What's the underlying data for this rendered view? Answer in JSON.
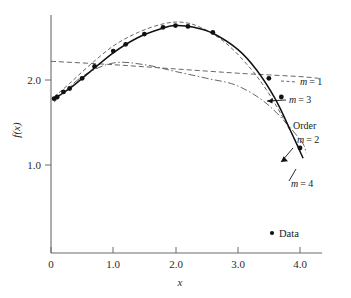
{
  "chart_data": {
    "type": "line",
    "title": "",
    "subtitle": "",
    "xlabel": "x",
    "ylabel": "f(x)",
    "xlim": [
      -0.05,
      4.4
    ],
    "ylim": [
      0.55,
      2.95
    ],
    "xticks": [
      0,
      1.0,
      2.0,
      3.0,
      4.0
    ],
    "xtick_labels": [
      "0",
      "1.0",
      "2.0",
      "3.0",
      "4.0"
    ],
    "yticks": [
      1.0,
      2.0
    ],
    "ytick_labels": [
      "1.0",
      "2.0"
    ],
    "grid": false,
    "legend_position": "bottom-right",
    "legend_entries": [
      "Data"
    ],
    "scatter": {
      "name": "Data",
      "marker": "filled-circle",
      "color": "#111111",
      "x": [
        0.05,
        0.1,
        0.2,
        0.3,
        0.5,
        0.7,
        1.0,
        1.2,
        1.5,
        1.8,
        2.0,
        2.2,
        2.6,
        3.5,
        3.7,
        4.0
      ],
      "y": [
        1.78,
        1.8,
        1.86,
        1.9,
        2.02,
        2.16,
        2.34,
        2.42,
        2.54,
        2.62,
        2.64,
        2.63,
        2.56,
        2.02,
        1.8,
        1.2
      ]
    },
    "series": [
      {
        "name": "m = 1",
        "order": 1,
        "style": "dashed",
        "color": "#555555",
        "x": [
          0.0,
          1.0,
          2.0,
          3.0,
          3.5,
          4.0,
          4.3
        ],
        "y": [
          2.22,
          2.18,
          2.13,
          2.08,
          2.06,
          2.04,
          2.02
        ]
      },
      {
        "name": "m = 2",
        "order": 2,
        "style": "dash-dot",
        "color": "#555555",
        "x": [
          0.05,
          0.5,
          1.0,
          1.5,
          2.0,
          2.5,
          3.0,
          3.5,
          4.0,
          4.1
        ],
        "y": [
          1.74,
          2.04,
          2.2,
          2.18,
          2.1,
          2.02,
          1.93,
          1.7,
          1.3,
          1.14
        ]
      },
      {
        "name": "m = 3",
        "order": 3,
        "style": "dashed",
        "color": "#555555",
        "x": [
          0.05,
          0.3,
          0.6,
          1.0,
          1.4,
          1.8,
          2.1,
          2.4,
          2.8,
          3.2,
          3.5,
          3.8,
          4.0
        ],
        "y": [
          1.8,
          1.96,
          2.16,
          2.4,
          2.56,
          2.66,
          2.68,
          2.62,
          2.44,
          2.14,
          1.84,
          1.46,
          1.18
        ]
      },
      {
        "name": "m = 4",
        "order": 4,
        "style": "solid",
        "color": "#111111",
        "x": [
          0.05,
          0.3,
          0.6,
          1.0,
          1.4,
          1.8,
          2.0,
          2.3,
          2.6,
          3.0,
          3.3,
          3.6,
          3.85,
          4.05
        ],
        "y": [
          1.78,
          1.9,
          2.08,
          2.32,
          2.5,
          2.61,
          2.64,
          2.62,
          2.55,
          2.36,
          2.12,
          1.78,
          1.4,
          1.08
        ]
      }
    ],
    "annotations": [
      {
        "id": "m1",
        "text_prefix": "m",
        "text_suffix": "= 1",
        "x_px": 314,
        "y_px": 83
      },
      {
        "id": "m3",
        "text_prefix": "m",
        "text_suffix": "= 3",
        "x_px": 303,
        "y_px": 101
      },
      {
        "id": "order",
        "text_prefix": "",
        "text_suffix": "Order",
        "x_px": 312,
        "y_px": 127
      },
      {
        "id": "m2",
        "text_prefix": "m",
        "text_suffix": "= 2",
        "x_px": 311,
        "y_px": 141
      },
      {
        "id": "m4",
        "text_prefix": "m",
        "text_suffix": "= 4",
        "x_px": 305,
        "y_px": 185
      }
    ]
  },
  "labels": {
    "xaxis_title": "x",
    "yaxis_title": "f(x)",
    "xtick_0": "0",
    "xtick_1": "1.0",
    "xtick_2": "2.0",
    "xtick_3": "3.0",
    "xtick_4": "4.0",
    "ytick_1": "1.0",
    "ytick_2": "2.0"
  },
  "annotation_text": {
    "m1_var": "m",
    "m1_val": "= 1",
    "m3_var": "m",
    "m3_val": "= 3",
    "order": "Order",
    "m2_var": "m",
    "m2_val": "= 2",
    "m4_var": "m",
    "m4_val": "= 4"
  },
  "legend": {
    "data_label": "Data",
    "marker_glyph": "●"
  },
  "colors": {
    "axis": "#6b6b6b",
    "data_marker": "#111111",
    "solid_curve": "#111111",
    "dashed_curve": "#555555",
    "text": "#1a1a1a",
    "background": "#ffffff"
  }
}
